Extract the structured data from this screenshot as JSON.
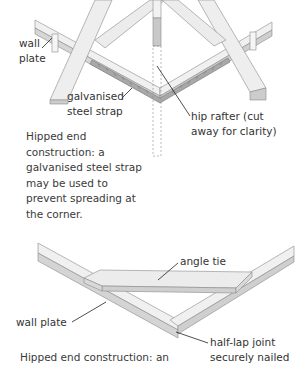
{
  "figure1": {
    "labels": {
      "wall_plate_line1": "wall",
      "wall_plate_line2": "plate",
      "strap_line1": "galvanised",
      "strap_line2": "steel strap",
      "hip_line1": "hip rafter (cut",
      "hip_line2": "away for clarity)"
    },
    "caption": {
      "line1": "Hipped end",
      "line2": "construction: a",
      "line3": "galvanised steel strap",
      "line4": "may be used to",
      "line5": "prevent spreading at",
      "line6": "the corner."
    }
  },
  "figure2": {
    "labels": {
      "angle_tie": "angle  tie",
      "wall_plate": "wall plate",
      "joint_line1": "half-lap joint",
      "joint_line2": "securely nailed"
    },
    "caption": {
      "line1": "Hipped end construction: an"
    }
  },
  "colors": {
    "timber_top": "#f2f2f2",
    "timber_side": "#d9d9d9",
    "timber_dark": "#c4c4c4",
    "strap": "#9a9a9a",
    "outline": "#8a8a8a",
    "leader": "#222222"
  }
}
